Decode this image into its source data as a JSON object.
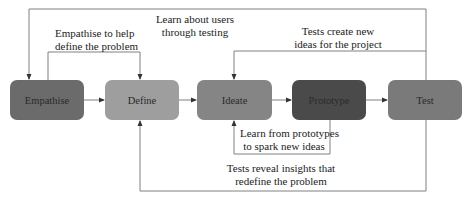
{
  "diagram": {
    "type": "design-thinking-process",
    "stages": [
      {
        "id": "empathise",
        "label": "Empathise",
        "color": "#6b6b6b"
      },
      {
        "id": "define",
        "label": "Define",
        "color": "#9e9e9e"
      },
      {
        "id": "ideate",
        "label": "Ideate",
        "color": "#858585"
      },
      {
        "id": "prototype",
        "label": "Prototype",
        "color": "#4a4a4a"
      },
      {
        "id": "test",
        "label": "Test",
        "color": "#7a7a7a"
      }
    ],
    "annotations": {
      "empathise_define": "Empathise to help define the problem",
      "empathise_define_line1": "Empathise to help",
      "empathise_define_line2": "define the problem",
      "test_empathise_line1": "Learn about users",
      "test_empathise_line2": "through testing",
      "test_ideate_line1": "Tests create new",
      "test_ideate_line2": "ideas for the project",
      "prototype_ideate_line1": "Learn from prototypes",
      "prototype_ideate_line2": "to spark new ideas",
      "test_define_line1": "Tests reveal insights that",
      "test_define_line2": "redefine the problem"
    },
    "edges": [
      {
        "from": "empathise",
        "to": "define",
        "kind": "forward"
      },
      {
        "from": "define",
        "to": "ideate",
        "kind": "forward"
      },
      {
        "from": "ideate",
        "to": "prototype",
        "kind": "forward"
      },
      {
        "from": "prototype",
        "to": "test",
        "kind": "forward"
      },
      {
        "from": "empathise",
        "to": "define",
        "kind": "loop",
        "label": "Empathise to help define the problem"
      },
      {
        "from": "test",
        "to": "empathise",
        "kind": "feedback",
        "label": "Learn about users through testing"
      },
      {
        "from": "test",
        "to": "ideate",
        "kind": "feedback",
        "label": "Tests create new ideas for the project"
      },
      {
        "from": "prototype",
        "to": "ideate",
        "kind": "feedback",
        "label": "Learn from prototypes to spark new ideas"
      },
      {
        "from": "test",
        "to": "define",
        "kind": "feedback",
        "label": "Tests reveal insights that redefine the problem"
      }
    ],
    "line_color": "#777777"
  }
}
